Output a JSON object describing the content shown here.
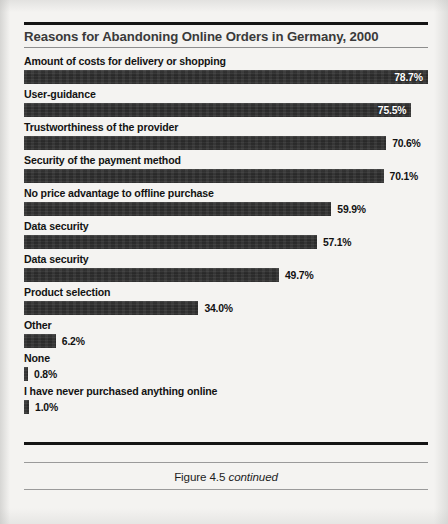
{
  "figure": {
    "title": "Reasons for Abandoning Online Orders in Germany, 2000",
    "caption_main": "Figure 4.5",
    "caption_italic": "continued",
    "bar_color": "#2f2f2f",
    "background_color": "#f4f3f1",
    "rule_color": "#141414"
  },
  "chart_data": {
    "type": "bar",
    "orientation": "horizontal",
    "title": "Reasons for Abandoning Online Orders in Germany, 2000",
    "xlabel": "",
    "ylabel": "",
    "xlim": [
      0,
      100
    ],
    "unit": "%",
    "grid": false,
    "legend": null,
    "categories": [
      "Amount of costs for delivery or shopping",
      "User-guidance",
      "Trustworthiness of the provider",
      "Security of the payment method",
      "No price advantage to offline purchase",
      "Data security",
      "Data security",
      "Product selection",
      "Other",
      "None",
      "I have never purchased anything online"
    ],
    "values": [
      78.7,
      75.5,
      70.6,
      70.1,
      59.9,
      57.1,
      49.7,
      34.0,
      6.2,
      0.8,
      1.0
    ],
    "labels": [
      "78.7%",
      "75.5%",
      "70.6%",
      "70.1%",
      "59.9%",
      "57.1%",
      "49.7%",
      "34.0%",
      "6.2%",
      "0.8%",
      "1.0%"
    ],
    "label_placement": [
      "inside",
      "inside",
      "outside",
      "outside",
      "outside",
      "outside",
      "outside",
      "outside",
      "outside",
      "outside",
      "outside"
    ]
  },
  "bars": [
    {
      "label": "Amount of costs for delivery or shopping",
      "value": 78.7,
      "value_label": "78.7%",
      "placement": "inside"
    },
    {
      "label": "User-guidance",
      "value": 75.5,
      "value_label": "75.5%",
      "placement": "inside"
    },
    {
      "label": "Trustworthiness of the provider",
      "value": 70.6,
      "value_label": "70.6%",
      "placement": "outside"
    },
    {
      "label": "Security of the payment method",
      "value": 70.1,
      "value_label": "70.1%",
      "placement": "outside"
    },
    {
      "label": "No price advantage to offline purchase",
      "value": 59.9,
      "value_label": "59.9%",
      "placement": "outside"
    },
    {
      "label": "Data security",
      "value": 57.1,
      "value_label": "57.1%",
      "placement": "outside"
    },
    {
      "label": "Data security",
      "value": 49.7,
      "value_label": "49.7%",
      "placement": "outside"
    },
    {
      "label": "Product selection",
      "value": 34.0,
      "value_label": "34.0%",
      "placement": "outside"
    },
    {
      "label": "Other",
      "value": 6.2,
      "value_label": "6.2%",
      "placement": "outside"
    },
    {
      "label": "None",
      "value": 0.8,
      "value_label": "0.8%",
      "placement": "outside"
    },
    {
      "label": "I have never purchased anything online",
      "value": 1.0,
      "value_label": "1.0%",
      "placement": "outside"
    }
  ]
}
